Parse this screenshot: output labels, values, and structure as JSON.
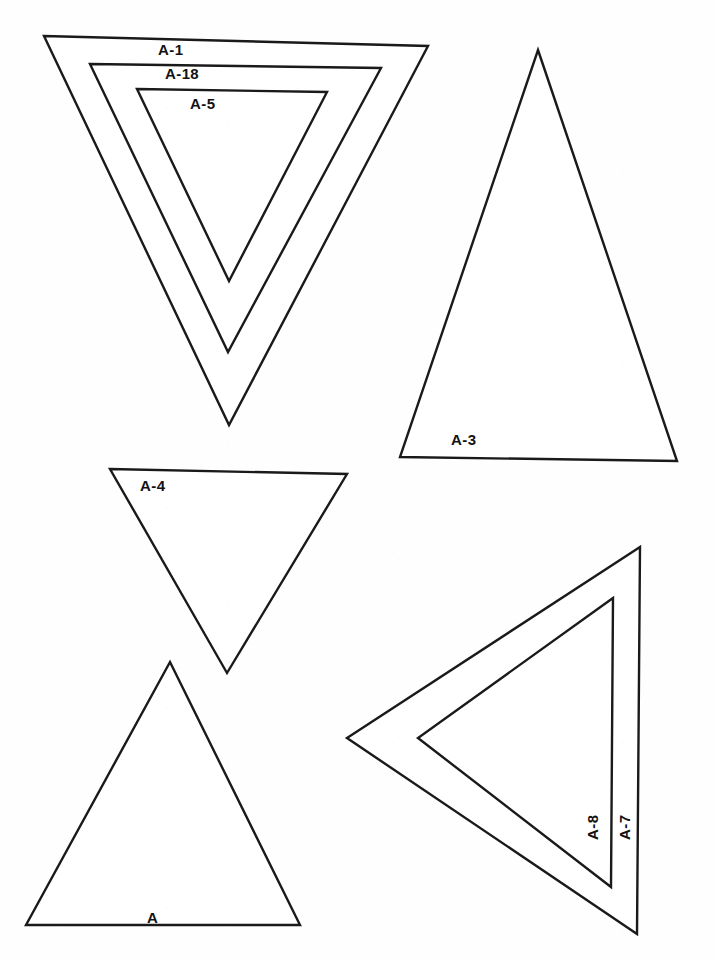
{
  "sheet": {
    "width": 717,
    "height": 961,
    "background_color": "#fefefe",
    "ink_color": "#1a1a1a",
    "description": "Scanned technical template sheet of eight outlined triangles with part-number labels"
  },
  "shapes": [
    {
      "id": "a-1",
      "label": "A-1",
      "orientation": "inverted",
      "points": "44,36 428,46 229,425",
      "label_x": 158,
      "label_y": 42,
      "rotation": 0
    },
    {
      "id": "a-18",
      "label": "A-18",
      "orientation": "inverted",
      "points": "90,64 381,68 228,352",
      "label_x": 165,
      "label_y": 66,
      "rotation": 0
    },
    {
      "id": "a-5",
      "label": "A-5",
      "orientation": "inverted",
      "points": "137,89 327,92 229,281",
      "label_x": 190,
      "label_y": 96,
      "rotation": 0
    },
    {
      "id": "a-3",
      "label": "A-3",
      "orientation": "upright",
      "points": "538,50 677,461 400,457",
      "label_x": 451,
      "label_y": 432,
      "rotation": 0
    },
    {
      "id": "a-4",
      "label": "A-4",
      "orientation": "inverted",
      "points": "110,469 347,474 227,673",
      "label_x": 140,
      "label_y": 478,
      "rotation": 0
    },
    {
      "id": "a",
      "label": "A",
      "orientation": "upright",
      "points": "170,662 300,925 26,925",
      "label_x": 147,
      "label_y": 910,
      "rotation": 0
    },
    {
      "id": "a-7",
      "label": "A-7",
      "orientation": "left-pointing",
      "points": "640,547 347,738 637,934",
      "label_x": 632,
      "label_y": 825,
      "rotation": -90
    },
    {
      "id": "a-8",
      "label": "A-8",
      "orientation": "left-pointing",
      "points": "613,598 418,738 611,887",
      "label_x": 600,
      "label_y": 825,
      "rotation": -90
    }
  ]
}
